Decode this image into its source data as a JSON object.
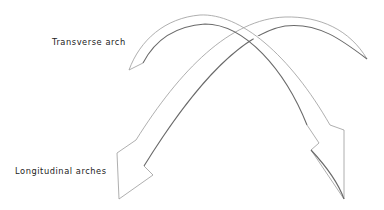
{
  "diagram": {
    "labels": {
      "transverse": "Transverse arch",
      "longitudinal": "Longitudinal arches"
    },
    "colors": {
      "background": "#ffffff",
      "text": "#222222",
      "outline_light": "#9a9a9a",
      "outline_dark": "#6a6a6a"
    },
    "shapes": [
      {
        "name": "arch-left-to-right",
        "start": "pointed tip near transverse label",
        "end": "arrowhead lower right"
      },
      {
        "name": "arch-right-to-left",
        "start": "pointed tip upper right",
        "end": "arrowhead lower left"
      }
    ]
  }
}
